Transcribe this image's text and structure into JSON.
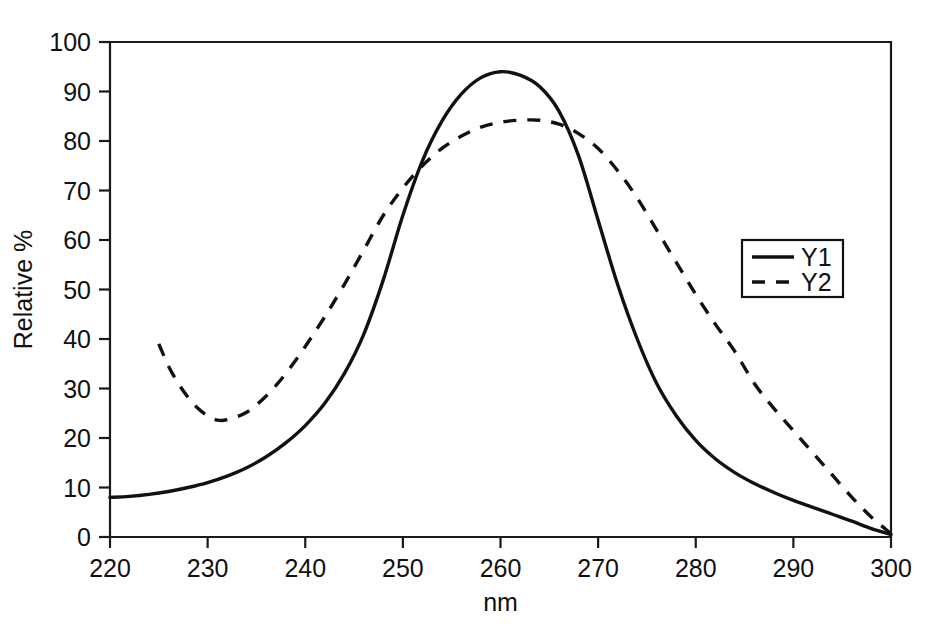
{
  "chart_data": {
    "type": "line",
    "title": "",
    "xlabel": "nm",
    "ylabel": "Relative %",
    "xlim": [
      220,
      300
    ],
    "ylim": [
      0,
      100
    ],
    "xticks": [
      220,
      230,
      240,
      250,
      260,
      270,
      280,
      290,
      300
    ],
    "yticks": [
      0,
      10,
      20,
      30,
      40,
      50,
      60,
      70,
      80,
      90,
      100
    ],
    "grid": false,
    "legend_position": "right-middle",
    "frame": "box",
    "series": [
      {
        "name": "Y1",
        "style": "solid",
        "color": "#111111",
        "x": [
          220,
          222,
          224,
          226,
          228,
          230,
          232,
          234,
          236,
          238,
          240,
          242,
          244,
          246,
          248,
          250,
          252,
          254,
          256,
          258,
          260,
          262,
          264,
          266,
          268,
          270,
          272,
          274,
          276,
          278,
          280,
          282,
          284,
          286,
          288,
          290,
          292,
          294,
          296,
          298,
          300
        ],
        "y": [
          8.0,
          8.2,
          8.6,
          9.2,
          10.0,
          11.0,
          12.3,
          14.0,
          16.2,
          19.0,
          22.5,
          27.0,
          33.0,
          41.0,
          52.0,
          65.0,
          76.0,
          84.0,
          89.5,
          92.8,
          94.0,
          93.3,
          91.0,
          86.0,
          77.0,
          64.0,
          51.0,
          40.0,
          31.0,
          24.5,
          19.5,
          15.8,
          13.0,
          10.8,
          9.0,
          7.4,
          6.0,
          4.6,
          3.2,
          1.7,
          0.5
        ]
      },
      {
        "name": "Y2",
        "style": "dashed",
        "color": "#111111",
        "x": [
          225,
          226,
          227,
          228,
          229,
          230,
          231,
          232,
          234,
          236,
          238,
          240,
          242,
          244,
          246,
          248,
          250,
          252,
          254,
          256,
          258,
          260,
          262,
          264,
          266,
          268,
          270,
          272,
          274,
          276,
          278,
          280,
          282,
          284,
          286,
          288,
          290,
          292,
          294,
          296,
          298,
          300
        ],
        "y": [
          39.0,
          34.5,
          31.0,
          28.2,
          26.0,
          24.5,
          23.6,
          23.7,
          25.2,
          28.5,
          33.0,
          38.5,
          44.5,
          51.0,
          58.0,
          65.0,
          70.5,
          75.0,
          78.5,
          81.0,
          82.8,
          83.8,
          84.2,
          84.2,
          83.4,
          81.5,
          78.5,
          74.0,
          68.5,
          62.0,
          55.5,
          49.0,
          43.0,
          37.5,
          31.0,
          26.0,
          21.5,
          17.0,
          12.5,
          8.0,
          4.0,
          0.7
        ]
      }
    ],
    "annotations": []
  },
  "legend": {
    "entries": [
      {
        "label": "Y1",
        "style": "solid"
      },
      {
        "label": "Y2",
        "style": "dashed"
      }
    ]
  },
  "axes": {
    "x_title": "nm",
    "y_title": "Relative %",
    "x_tick_labels": [
      "220",
      "230",
      "240",
      "250",
      "260",
      "270",
      "280",
      "290",
      "300"
    ],
    "y_tick_labels": [
      "0",
      "10",
      "20",
      "30",
      "40",
      "50",
      "60",
      "70",
      "80",
      "90",
      "100"
    ]
  }
}
